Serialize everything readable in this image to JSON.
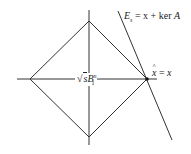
{
  "diagram": {
    "labels": {
      "center": {
        "sqrt": "√",
        "s": "s",
        "B": "B",
        "sup": "n",
        "sub": "1"
      },
      "line": {
        "E": "E",
        "sub": "s",
        "rest": " = x + ker ",
        "A": "A"
      },
      "point": {
        "x_hat": "x",
        "eq": " = ",
        "x": "x"
      }
    },
    "colors": {
      "stroke": "#333333",
      "background": "#ffffff"
    }
  }
}
